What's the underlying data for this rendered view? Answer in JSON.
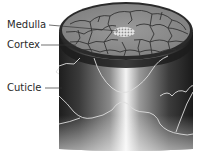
{
  "diagram": {
    "labels": [
      {
        "id": "medulla",
        "text": "Medulla"
      },
      {
        "id": "cortex",
        "text": "Cortex"
      },
      {
        "id": "cuticle",
        "text": "Cuticle"
      }
    ],
    "colors": {
      "background": "#ffffff",
      "text": "#2a2a2a",
      "shaft_dark": "#2b2b2b",
      "shaft_mid": "#7a7a7a",
      "shaft_highlight": "#f2f2f2",
      "cortex_cells": "#8c8c8c",
      "cell_borders": "#3a3a3a",
      "cuticle_lines": "#d8d8d8"
    }
  }
}
